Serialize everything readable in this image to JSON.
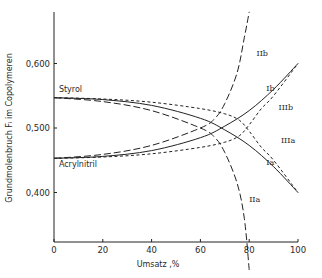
{
  "chart_data": {
    "type": "line",
    "title": "",
    "xlabel": "Umsatz ,%",
    "ylabel": "Grundmolenbruch Fᵢ im Copolymeren",
    "xlim": [
      0,
      100
    ],
    "ylim": [
      0.28,
      0.68
    ],
    "x_ticks": [
      0,
      20,
      40,
      60,
      80,
      100
    ],
    "x_tick_labels": [
      "0",
      "20",
      "40",
      "60",
      "80",
      "100"
    ],
    "y_ticks": [
      0.4,
      0.5,
      0.6
    ],
    "y_tick_labels": [
      "0,400",
      "0,500",
      "0,600"
    ],
    "grid": false,
    "legend": "none (curves labelled inline)",
    "annotations": [
      {
        "text": "Styrol",
        "x": 2,
        "y": 0.556
      },
      {
        "text": "Acrylnitril",
        "x": 2,
        "y": 0.44
      }
    ],
    "series": [
      {
        "name": "Ia",
        "style": "solid",
        "x": [
          0,
          20,
          40,
          60,
          70,
          80,
          90,
          100
        ],
        "y": [
          0.547,
          0.544,
          0.535,
          0.515,
          0.497,
          0.473,
          0.44,
          0.4
        ]
      },
      {
        "name": "Ib",
        "style": "solid",
        "x": [
          0,
          20,
          40,
          60,
          70,
          80,
          90,
          100
        ],
        "y": [
          0.453,
          0.456,
          0.465,
          0.485,
          0.503,
          0.527,
          0.56,
          0.6
        ]
      },
      {
        "name": "IIa",
        "style": "long-dash",
        "x": [
          0,
          20,
          40,
          60,
          66,
          70,
          75,
          78,
          80
        ],
        "y": [
          0.547,
          0.541,
          0.527,
          0.5,
          0.485,
          0.462,
          0.415,
          0.36,
          0.28
        ]
      },
      {
        "name": "IIb",
        "style": "long-dash",
        "x": [
          0,
          20,
          40,
          60,
          66,
          70,
          75,
          78,
          80
        ],
        "y": [
          0.453,
          0.459,
          0.473,
          0.5,
          0.515,
          0.538,
          0.585,
          0.64,
          0.68
        ]
      },
      {
        "name": "IIIa",
        "style": "short-dash",
        "x": [
          0,
          20,
          40,
          60,
          70,
          76,
          80,
          85,
          90,
          100
        ],
        "y": [
          0.547,
          0.545,
          0.54,
          0.53,
          0.522,
          0.512,
          0.495,
          0.47,
          0.45,
          0.4
        ]
      },
      {
        "name": "IIIb",
        "style": "short-dash",
        "x": [
          0,
          20,
          40,
          60,
          70,
          76,
          80,
          85,
          90,
          100
        ],
        "y": [
          0.453,
          0.455,
          0.46,
          0.47,
          0.478,
          0.488,
          0.505,
          0.53,
          0.55,
          0.6
        ]
      }
    ],
    "series_labels": [
      {
        "name": "IIb",
        "x": 83,
        "y": 0.612
      },
      {
        "name": "Ib",
        "x": 87,
        "y": 0.558
      },
      {
        "name": "IIIb",
        "x": 92,
        "y": 0.528
      },
      {
        "name": "IIIa",
        "x": 93,
        "y": 0.476
      },
      {
        "name": "Ia",
        "x": 87,
        "y": 0.443
      },
      {
        "name": "IIa",
        "x": 80,
        "y": 0.385
      }
    ]
  }
}
